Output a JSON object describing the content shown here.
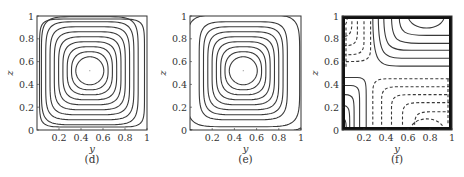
{
  "chart_data": [
    {
      "type": "contour",
      "panel": "(d)",
      "caption": "(d)",
      "xlabel": "y",
      "ylabel": "z",
      "xlim": [
        0,
        1
      ],
      "ylim": [
        0,
        1
      ],
      "xticks": [
        "0.2",
        "0.4",
        "0.6",
        "0.8",
        "1"
      ],
      "yticks": [
        "0",
        "0.2",
        "0.4",
        "0.6",
        "0.8",
        "1"
      ],
      "line_style": "solid",
      "center": [
        0.48,
        0.52
      ],
      "n_contours": 10,
      "description": "Nested closed rounded-square streamlines centred near (0.48, 0.52); outermost contour closed, hugging walls"
    },
    {
      "type": "contour",
      "panel": "(e)",
      "caption": "(e)",
      "xlabel": "y",
      "ylabel": "z",
      "xlim": [
        0,
        1
      ],
      "ylim": [
        0,
        1
      ],
      "xticks": [
        "0.2",
        "0.4",
        "0.6",
        "0.8",
        "1"
      ],
      "yticks": [
        "0",
        "0.2",
        "0.4",
        "0.6",
        "0.8",
        "1"
      ],
      "line_style": "solid",
      "center": [
        0.48,
        0.52
      ],
      "n_contours": 10,
      "description": "Nested closed streamlines centred near (0.48, 0.52); outermost contours open, intersecting side walls near z≈0.15, 0.3, 0.67, 0.85"
    },
    {
      "type": "contour",
      "panel": "(f)",
      "caption": "(f)",
      "xlabel": "y",
      "ylabel": "z",
      "xlim": [
        0,
        1
      ],
      "ylim": [
        0,
        1
      ],
      "xticks": [
        "0.2",
        "0.4",
        "0.6",
        "0.8",
        "1"
      ],
      "yticks": [
        "0",
        "0.2",
        "0.4",
        "0.6",
        "0.8",
        "1"
      ],
      "line_style": "solid (positive) and dashed (negative)",
      "description": "Four-cell pattern: solid contours in upper-right and lower-left quadrants, dashed contours in upper-left and lower-right quadrants; thick boundary layers along walls"
    }
  ],
  "panels": [
    {
      "id": "d",
      "caption": "(d)",
      "xlabel": "y",
      "ylabel": "z"
    },
    {
      "id": "e",
      "caption": "(e)",
      "xlabel": "y",
      "ylabel": "z"
    },
    {
      "id": "f",
      "caption": "(f)",
      "xlabel": "y",
      "ylabel": "z"
    }
  ],
  "ticks": {
    "x": [
      "0.2",
      "0.4",
      "0.6",
      "0.8",
      "1"
    ],
    "y": [
      "0",
      "0.2",
      "0.4",
      "0.6",
      "0.8",
      "1"
    ]
  }
}
